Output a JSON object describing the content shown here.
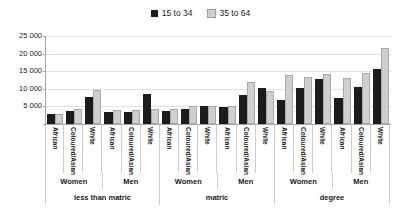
{
  "chart_data": {
    "type": "bar",
    "title": "",
    "subtitle": "",
    "xlabel": "",
    "ylabel": "",
    "ylim": [
      0,
      25000
    ],
    "grid": true,
    "legend_position": "top-center",
    "ytick_labels": [
      "25 000",
      "20 000",
      "15 000",
      "10 000",
      "5 000",
      ""
    ],
    "ytick_values": [
      25000,
      20000,
      15000,
      10000,
      5000,
      0
    ],
    "categories": [
      "African",
      "Coloured/Asian",
      "White",
      "African",
      "Coloured/Asian",
      "White",
      "African",
      "Coloured/Asian",
      "White",
      "African",
      "Coloured/Asian",
      "White",
      "African",
      "Coloured/Asian",
      "White",
      "African",
      "Coloured/Asian",
      "White"
    ],
    "group_labels": [
      "Women",
      "Men",
      "Women",
      "Men",
      "Women",
      "Men"
    ],
    "supergroup_labels": [
      "less than matric",
      "matric",
      "degree"
    ],
    "series": [
      {
        "name": "15 to 34",
        "color": "#1c1c1c",
        "values": [
          2900,
          3700,
          7800,
          3300,
          3400,
          8400,
          3700,
          4400,
          5100,
          4700,
          8200,
          10200,
          6800,
          10100,
          12700,
          7400,
          10400,
          15500
        ]
      },
      {
        "name": "35 to 64",
        "color": "#cfcfcf",
        "values": [
          2800,
          4200,
          9600,
          4100,
          4000,
          4300,
          4400,
          5000,
          5000,
          5200,
          12000,
          9400,
          14000,
          13400,
          14100,
          13100,
          14400,
          21600
        ]
      }
    ]
  },
  "legend": {
    "entries": [
      {
        "label": "15 to 34",
        "swatch": "dark-square-icon"
      },
      {
        "label": "35 to 64",
        "swatch": "light-square-icon"
      }
    ]
  }
}
